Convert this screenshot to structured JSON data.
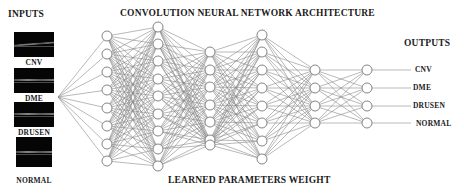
{
  "title": "CONVOLUTION NEURAL NETWORK ARCHITECTURE",
  "footer": "LEARNED PARAMETERS WEIGHT",
  "inputs": {
    "heading": "INPUTS",
    "items": [
      {
        "label": "CNV",
        "img": {
          "x": 14,
          "y": 32,
          "w": 40,
          "h": 25
        },
        "label_y": 58
      },
      {
        "label": "DME",
        "img": {
          "x": 14,
          "y": 68,
          "w": 40,
          "h": 25
        },
        "label_y": 94
      },
      {
        "label": "DRUSEN",
        "img": {
          "x": 14,
          "y": 102,
          "w": 40,
          "h": 25
        },
        "label_y": 128
      },
      {
        "label": "NORMAL",
        "img": {
          "x": 16,
          "y": 137,
          "w": 36,
          "h": 30
        },
        "label_y": 176
      }
    ]
  },
  "outputs": {
    "heading": "OUTPUTS",
    "items": [
      {
        "label": "CNV"
      },
      {
        "label": "DME"
      },
      {
        "label": "DRUSEN"
      },
      {
        "label": "NORMAL"
      }
    ]
  },
  "network": {
    "fan_origin": {
      "x": 58,
      "y": 97
    },
    "node_radius": 5,
    "line_color": "#8a8a8a",
    "node_stroke": "#777777",
    "layers": [
      {
        "x": 107,
        "ys": [
          36,
          54,
          72,
          90,
          108,
          126,
          144,
          161
        ]
      },
      {
        "x": 158,
        "ys": [
          27,
          44,
          61,
          79,
          96,
          114,
          131,
          149,
          166
        ]
      },
      {
        "x": 210,
        "ys": [
          52,
          70,
          87,
          105,
          122,
          140,
          145
        ]
      },
      {
        "x": 262,
        "ys": [
          35,
          52,
          70,
          88,
          106,
          123,
          141,
          159
        ]
      },
      {
        "x": 315,
        "ys": [
          70,
          88,
          106,
          123
        ]
      },
      {
        "x": 367,
        "ys": [
          70,
          88,
          106,
          123
        ]
      }
    ],
    "output_line_end_x": 411
  }
}
